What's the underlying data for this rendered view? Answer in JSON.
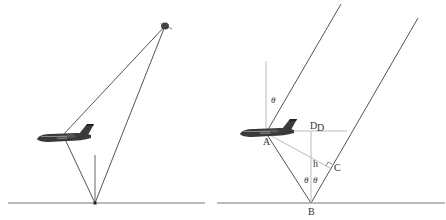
{
  "figure": {
    "left_panel": {
      "description": "Satellite signal reflected from ground to aircraft",
      "objects": [
        "aircraft",
        "satellite",
        "ground",
        "ground-normal"
      ]
    },
    "right_panel": {
      "description": "Geometry of direct and reflected rays",
      "labels": {
        "A": "A",
        "B": "B",
        "C": "C",
        "D": "D",
        "D2": "D",
        "h": "h",
        "theta_top": "θ",
        "theta_left": "θ",
        "theta_right": "θ"
      }
    }
  },
  "colors": {
    "line": "#555555",
    "light_line": "#bbbbbb",
    "ground": "#777777",
    "aircraft": "#3a3a3a"
  }
}
